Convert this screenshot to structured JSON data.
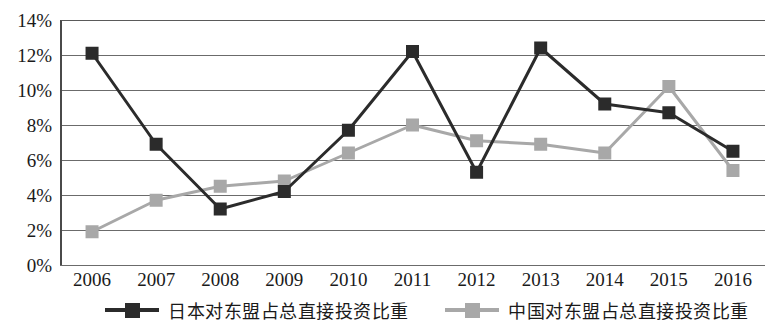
{
  "chart_data": {
    "type": "line",
    "title": "",
    "xlabel": "",
    "ylabel": "",
    "ylim": [
      0,
      14
    ],
    "ytick_step": 2,
    "grid": true,
    "legend_position": "bottom",
    "categories": [
      "2006",
      "2007",
      "2008",
      "2009",
      "2010",
      "2011",
      "2012",
      "2013",
      "2014",
      "2015",
      "2016"
    ],
    "ytick_labels": [
      "14%",
      "12%",
      "10%",
      "8%",
      "6%",
      "4%",
      "2%",
      "0%"
    ],
    "ytick_values": [
      14,
      12,
      10,
      8,
      6,
      4,
      2,
      0
    ],
    "series": [
      {
        "name": "日本对东盟占总直接投资比重",
        "color": "#2b2b2b",
        "marker": "square",
        "values": [
          12.1,
          6.9,
          3.2,
          4.2,
          7.7,
          12.2,
          5.3,
          12.4,
          9.2,
          8.7,
          6.5
        ]
      },
      {
        "name": "中国对东盟占总直接投资比重",
        "color": "#a8a8a8",
        "marker": "square",
        "values": [
          1.9,
          3.7,
          4.5,
          4.8,
          6.4,
          8.0,
          7.1,
          6.9,
          6.4,
          10.2,
          5.4
        ]
      }
    ]
  },
  "legend": {
    "items": [
      {
        "label": "日本对东盟占总直接投资比重",
        "color": "#2b2b2b"
      },
      {
        "label": "中国对东盟占总直接投资比重",
        "color": "#a8a8a8"
      }
    ]
  }
}
